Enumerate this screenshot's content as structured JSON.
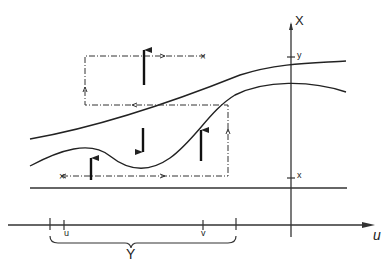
{
  "diagram": {
    "axes": {
      "vertical_label": "X",
      "horizontal_label": "u"
    },
    "ticks": {
      "vertical": [
        "y",
        "x"
      ],
      "horizontal": [
        "u",
        "v"
      ]
    },
    "brace_label": "Y",
    "colors": {
      "ink": "#222222",
      "background": "#ffffff"
    }
  }
}
